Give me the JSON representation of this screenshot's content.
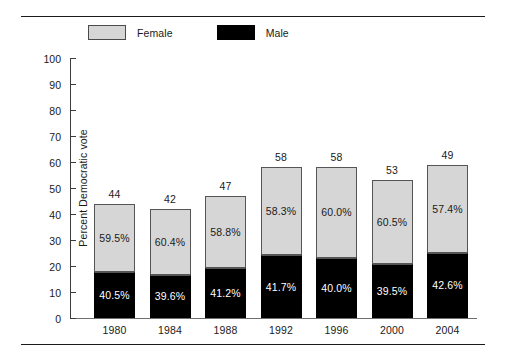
{
  "chart_data": {
    "type": "bar",
    "subtype": "stacked-100-percent-with-total-label",
    "title": "",
    "xlabel": "",
    "ylabel": "Percent Democratic vote",
    "ylim": [
      0,
      100
    ],
    "yticks": [
      0,
      10,
      20,
      30,
      40,
      50,
      60,
      70,
      80,
      90,
      100
    ],
    "grid": false,
    "legend_position": "top-left",
    "categories": [
      "1980",
      "1984",
      "1988",
      "1992",
      "1996",
      "2000",
      "2004"
    ],
    "bar_totals": [
      44,
      42,
      47,
      58,
      58,
      53,
      49
    ],
    "bar_heights_plotted": [
      44,
      42,
      47,
      58,
      58,
      53,
      59
    ],
    "series": [
      {
        "name": "Female",
        "color": "#d6d6d6",
        "values": [
          59.5,
          60.4,
          58.8,
          58.3,
          60.0,
          60.5,
          57.4
        ],
        "labels": [
          "59.5%",
          "60.4%",
          "58.8%",
          "58.3%",
          "60.0%",
          "60.5%",
          "57.4%"
        ]
      },
      {
        "name": "Male",
        "color": "#000000",
        "values": [
          40.5,
          39.6,
          41.2,
          41.7,
          40.0,
          39.5,
          42.6
        ],
        "labels": [
          "40.5%",
          "39.6%",
          "41.2%",
          "41.7%",
          "40.0%",
          "39.5%",
          "42.6%"
        ]
      }
    ],
    "total_labels": [
      "44",
      "42",
      "47",
      "58",
      "58",
      "53",
      "49"
    ]
  },
  "legend": {
    "items": [
      {
        "label": "Female",
        "swatch": "female-swatch"
      },
      {
        "label": "Male",
        "swatch": "male-swatch"
      }
    ]
  },
  "axis": {
    "y_title": "Percent Democratic vote",
    "y_ticks": [
      "100",
      "90",
      "80",
      "70",
      "60",
      "50",
      "40",
      "30",
      "20",
      "10",
      "0"
    ],
    "x_ticks": [
      "1980",
      "1984",
      "1988",
      "1992",
      "1996",
      "2000",
      "2004"
    ]
  }
}
